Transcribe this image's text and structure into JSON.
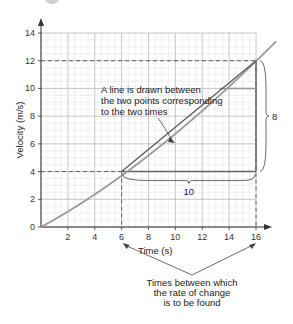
{
  "chart_data": {
    "type": "line",
    "title": "",
    "xlabel": "Time (s)",
    "ylabel": "Velocity (m/s)",
    "xlim": [
      0,
      16
    ],
    "ylim": [
      0,
      14
    ],
    "x_ticks": [
      2,
      4,
      6,
      8,
      10,
      12,
      14,
      16
    ],
    "y_ticks": [
      0,
      2,
      4,
      6,
      8,
      10,
      12,
      14
    ],
    "grid": true,
    "series": [
      {
        "name": "velocity curve",
        "x": [
          0,
          2,
          4,
          6,
          8,
          10,
          12,
          14,
          16,
          17.5
        ],
        "y": [
          0,
          1.2,
          2.5,
          4,
          5.6,
          7.4,
          9.3,
          11.5,
          12,
          13.4
        ]
      },
      {
        "name": "chord",
        "x": [
          6,
          16
        ],
        "y": [
          4,
          12
        ]
      }
    ],
    "annotations": {
      "chord_label": [
        "A line is drawn between",
        "the two points corresponding",
        "to the two times"
      ],
      "rise_label": "8",
      "run_label": "10",
      "times_label": [
        "Times between which",
        "the rate of change",
        "is to be found"
      ],
      "point_1": {
        "x": 6,
        "y": 4
      },
      "point_2": {
        "x": 16,
        "y": 12
      }
    },
    "colors": {
      "curve": "#999999",
      "chord": "#555555",
      "grid": "#cccccc",
      "axis": "#333333"
    }
  }
}
